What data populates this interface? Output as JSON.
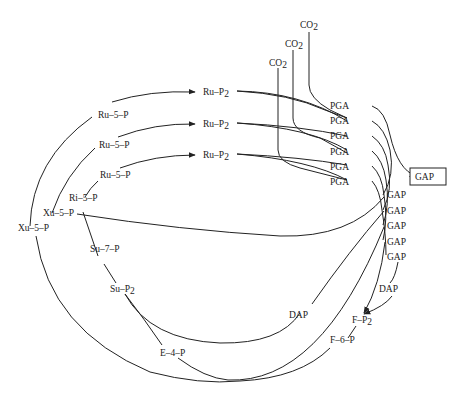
{
  "labels": {
    "co2": "CO",
    "co2_sub": "2",
    "ru_p2": "Ru–P",
    "ru_p2_sub": "2",
    "pga": "PGA",
    "gap": "GAP",
    "gap_product": "GAP",
    "ru5p": "Ru–5–P",
    "xu5p": "Xu–5–P",
    "ri5p": "Ri–5–P",
    "su7p": "Su–7–P",
    "su_p2": "Su–P",
    "su_p2_sub": "2",
    "e4p": "E–4–P",
    "dap": "DAP",
    "f_p2": "F–P",
    "f_p2_sub": "2",
    "f6p": "F–6–P"
  },
  "nodes": {
    "co2_count": 3,
    "ru_p2_count": 3,
    "pga_count": 6,
    "gap_count": 5,
    "ru5p_count": 3,
    "xu5p_count": 2,
    "dap_count": 2
  }
}
